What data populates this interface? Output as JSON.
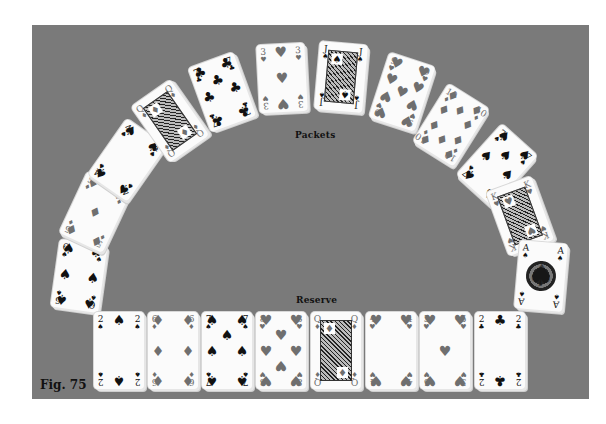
{
  "figure": {
    "label": "Fig. 75",
    "board_color": "#7a7a7a",
    "background_color": "#ffffff"
  },
  "sections": {
    "packets_label": "Packets",
    "reserve_label": "Reserve"
  },
  "packets": [
    {
      "rank": "6",
      "suit": "spades",
      "symbol": "♠",
      "color": "black"
    },
    {
      "rank": "5",
      "suit": "diamonds",
      "symbol": "♦",
      "color": "red"
    },
    {
      "rank": "4",
      "suit": "spades",
      "symbol": "♠",
      "color": "black"
    },
    {
      "rank": "Q",
      "suit": "diamonds",
      "symbol": "♦",
      "color": "red"
    },
    {
      "rank": "7",
      "suit": "clubs",
      "symbol": "♣",
      "color": "black"
    },
    {
      "rank": "3",
      "suit": "hearts",
      "symbol": "♥",
      "color": "red"
    },
    {
      "rank": "J",
      "suit": "spades",
      "symbol": "♠",
      "color": "black"
    },
    {
      "rank": "9",
      "suit": "hearts",
      "symbol": "♥",
      "color": "red"
    },
    {
      "rank": "10",
      "suit": "diamonds",
      "symbol": "♦",
      "color": "red"
    },
    {
      "rank": "7",
      "suit": "spades",
      "symbol": "♠",
      "color": "black"
    },
    {
      "rank": "K",
      "suit": "hearts",
      "symbol": "♥",
      "color": "red"
    },
    {
      "rank": "A",
      "suit": "spades",
      "symbol": "♠",
      "color": "black"
    }
  ],
  "reserve": [
    {
      "rank": "2",
      "suit": "spades",
      "symbol": "♠",
      "color": "black"
    },
    {
      "rank": "6",
      "suit": "diamonds",
      "symbol": "♦",
      "color": "red"
    },
    {
      "rank": "7",
      "suit": "spades",
      "symbol": "♠",
      "color": "black"
    },
    {
      "rank": "8",
      "suit": "hearts",
      "symbol": "♥",
      "color": "red"
    },
    {
      "rank": "Q",
      "suit": "diamonds",
      "symbol": "♦",
      "color": "red"
    },
    {
      "rank": "4",
      "suit": "hearts",
      "symbol": "♥",
      "color": "red"
    },
    {
      "rank": "5",
      "suit": "hearts",
      "symbol": "♥",
      "color": "red"
    },
    {
      "rank": "2",
      "suit": "clubs",
      "symbol": "♣",
      "color": "black"
    }
  ]
}
